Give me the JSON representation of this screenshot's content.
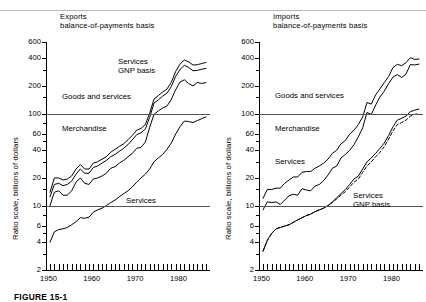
{
  "figure": {
    "caption": "FIGURE 15-1"
  },
  "axis": {
    "y_title": "Ratio scale, billions of dollars",
    "y_ticks": [
      "600",
      "400",
      "200",
      "100",
      "60",
      "40",
      "20",
      "10",
      "6",
      "4",
      "2"
    ],
    "x_ticks": [
      "1950",
      "1960",
      "1970",
      "1980"
    ]
  },
  "panels": [
    {
      "id": "exports",
      "title_line1": "Exports",
      "title_line2": "balance-of-payments basis",
      "labels": [
        {
          "name": "services-gnp",
          "line1": "Services",
          "line2": "GNP basis"
        },
        {
          "name": "goods-and-services",
          "line1": "Goods and services",
          "line2": ""
        },
        {
          "name": "merchandise",
          "line1": "Merchandise",
          "line2": ""
        },
        {
          "name": "services",
          "line1": "Services",
          "line2": ""
        }
      ]
    },
    {
      "id": "imports",
      "title_line1": "Imports",
      "title_line2": "balance-of-payments basis",
      "labels": [
        {
          "name": "goods-and-services",
          "line1": "Goods and services",
          "line2": ""
        },
        {
          "name": "merchandise",
          "line1": "Merchandise",
          "line2": ""
        },
        {
          "name": "services",
          "line1": "Services",
          "line2": ""
        },
        {
          "name": "services-gnp",
          "line1": "Services",
          "line2": "GNP basis"
        }
      ]
    }
  ],
  "chart_data": [
    {
      "type": "line",
      "id": "exports",
      "title": "Exports balance-of-payments basis",
      "xlabel": "",
      "ylabel": "Ratio scale, billions of dollars",
      "yscale": "log",
      "ylim": [
        2,
        600
      ],
      "xlim": [
        1950,
        1986
      ],
      "grid": false,
      "reference_lines": [
        10,
        100
      ],
      "legend": "inline-annotations",
      "x": [
        1950,
        1951,
        1952,
        1953,
        1954,
        1955,
        1956,
        1957,
        1958,
        1959,
        1960,
        1961,
        1962,
        1963,
        1964,
        1965,
        1966,
        1967,
        1968,
        1969,
        1970,
        1971,
        1972,
        1973,
        1974,
        1975,
        1976,
        1977,
        1978,
        1979,
        1980,
        1981,
        1982,
        1983,
        1984,
        1985,
        1986
      ],
      "series": [
        {
          "name": "Goods and services, GNP basis",
          "style": "solid",
          "values": [
            14,
            20,
            20,
            19,
            19.5,
            21,
            25,
            28,
            25,
            25,
            29,
            30,
            32,
            34,
            38,
            41,
            44,
            47,
            52,
            58,
            66,
            69,
            76,
            101,
            144,
            157,
            172,
            185,
            219,
            287,
            344,
            383,
            365,
            337,
            340,
            350,
            360
          ]
        },
        {
          "name": "Goods and services",
          "style": "solid",
          "values": [
            12.5,
            17,
            17.5,
            16.5,
            17,
            18.5,
            22,
            25,
            22.5,
            22.5,
            26,
            27,
            29,
            31,
            34,
            36,
            39,
            42,
            46,
            52,
            59,
            62,
            68,
            91,
            130,
            141,
            155,
            167,
            197,
            254,
            302,
            335,
            318,
            292,
            295,
            303,
            310
          ]
        },
        {
          "name": "Merchandise",
          "style": "solid",
          "values": [
            10,
            14,
            14.5,
            13,
            13,
            14.5,
            18,
            20,
            17.5,
            17,
            19.5,
            20,
            21,
            22.5,
            25.5,
            26.5,
            29,
            31,
            34,
            37,
            42,
            43,
            49,
            71,
            98,
            107,
            115,
            121,
            143,
            182,
            220,
            233,
            212,
            200,
            218,
            213,
            217
          ]
        },
        {
          "name": "Services",
          "style": "solid",
          "values": [
            4,
            5.2,
            5.5,
            5.6,
            5.8,
            6.2,
            6.7,
            7.4,
            7.3,
            7.5,
            8.5,
            9,
            9.4,
            10,
            10.8,
            11.5,
            12.5,
            13.5,
            14.5,
            16,
            18,
            20,
            22,
            25,
            30,
            33,
            36,
            41,
            48,
            60,
            72,
            83,
            82,
            80,
            84,
            88,
            92
          ]
        }
      ]
    },
    {
      "type": "line",
      "id": "imports",
      "title": "Imports balance-of-payments basis",
      "xlabel": "",
      "ylabel": "Ratio scale, billions of dollars",
      "yscale": "log",
      "ylim": [
        2,
        600
      ],
      "xlim": [
        1950,
        1986
      ],
      "grid": false,
      "reference_lines": [
        10,
        100
      ],
      "legend": "inline-annotations",
      "x": [
        1950,
        1951,
        1952,
        1953,
        1954,
        1955,
        1956,
        1957,
        1958,
        1959,
        1960,
        1961,
        1962,
        1963,
        1964,
        1965,
        1966,
        1967,
        1968,
        1969,
        1970,
        1971,
        1972,
        1973,
        1974,
        1975,
        1976,
        1977,
        1978,
        1979,
        1980,
        1981,
        1982,
        1983,
        1984,
        1985,
        1986
      ],
      "series": [
        {
          "name": "Goods and services",
          "style": "solid",
          "values": [
            12,
            15,
            15,
            15.5,
            15.5,
            17.5,
            19,
            20.5,
            20.5,
            23,
            23.5,
            23.5,
            25.5,
            27,
            29,
            32,
            37,
            40,
            47,
            51,
            60,
            66,
            76,
            92,
            132,
            127,
            160,
            186,
            218,
            254,
            317,
            343,
            332,
            358,
            405,
            388,
            392
          ]
        },
        {
          "name": "Merchandise",
          "style": "solid",
          "values": [
            9,
            11,
            10.8,
            11,
            10.3,
            11.5,
            12.8,
            13.3,
            13,
            15.3,
            14.8,
            14.5,
            16.3,
            17,
            18.7,
            21.5,
            25.5,
            26.9,
            33,
            36,
            40,
            46,
            56,
            70,
            103,
            98,
            124,
            152,
            176,
            212,
            250,
            265,
            247,
            269,
            341,
            338,
            345
          ]
        },
        {
          "name": "Services",
          "style": "solid",
          "values": [
            3.2,
            4.2,
            5.0,
            5.6,
            5.8,
            6.0,
            6.2,
            6.6,
            7.0,
            7.4,
            7.8,
            8.1,
            8.6,
            9.0,
            9.4,
            10.0,
            11.0,
            12.2,
            13.5,
            15.0,
            17.0,
            19.5,
            21,
            25,
            30,
            33,
            37,
            42,
            48,
            58,
            72,
            85,
            89,
            94,
            105,
            109,
            112
          ]
        },
        {
          "name": "Services, GNP basis",
          "style": "dashed",
          "values": [
            3.2,
            4.2,
            5.0,
            5.6,
            5.8,
            6.0,
            6.2,
            6.6,
            7.0,
            7.4,
            7.8,
            8.1,
            8.6,
            9.0,
            9.4,
            10.0,
            10.8,
            11.8,
            13.0,
            14.2,
            16.0,
            18.0,
            19.5,
            23,
            27,
            30,
            34,
            38,
            44,
            53,
            65,
            76,
            80,
            85,
            94,
            98,
            100
          ]
        }
      ]
    }
  ]
}
